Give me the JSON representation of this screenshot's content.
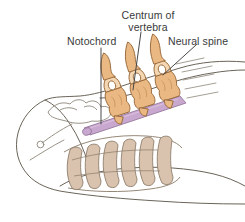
{
  "figure": {
    "background_color": "#ffffff"
  },
  "labels": {
    "notochord": "Notochord",
    "centrum_of_vertebra": "Centrum of vertebra",
    "neural_spine": "Neural spine"
  },
  "colors": {
    "outline": "#6b6459",
    "outline_light": "#8d867a",
    "bone_fill": "#eab883",
    "bone_fill_light": "#f3d6b2",
    "bone_stroke": "#9a6b3c",
    "notochord_fill": "#c9a8cf",
    "notochord_stroke": "#8e6f96",
    "rib_fill": "#d9c3ae",
    "rib_stroke": "#8a7a68",
    "leader_line": "#3f3f3f",
    "text": "#3a3a3a"
  },
  "structures": [
    {
      "name": "notochord",
      "description": "purple rod running anteroposteriorly beneath the vertebral centra",
      "color": "#c9a8cf"
    },
    {
      "name": "vertebra-1",
      "description": "anterior vertebra with centrum, neural arch and neural spine",
      "color": "#eab883"
    },
    {
      "name": "vertebra-2",
      "description": "middle vertebra with centrum, neural arch and neural spine",
      "color": "#eab883"
    },
    {
      "name": "vertebra-3",
      "description": "posterior vertebra with centrum, neural arch and neural spine",
      "color": "#eab883"
    },
    {
      "name": "gill-arches",
      "description": "series of looped gill arches / branchial basket below the skull",
      "color": "#d9c3ae"
    },
    {
      "name": "skull-outline",
      "description": "rounded snout and cranium outline of the fish head",
      "color": "#6b6459"
    }
  ],
  "leader_lines": [
    {
      "name": "notochord-leader",
      "from_label": "Notochord",
      "to_structure": "notochord"
    },
    {
      "name": "centrum-leader",
      "from_label": "Centrum of vertebra",
      "to_structure": "vertebra-2"
    },
    {
      "name": "neural-spine-leader",
      "from_label": "Neural spine",
      "to_structure": "vertebra-3"
    }
  ]
}
